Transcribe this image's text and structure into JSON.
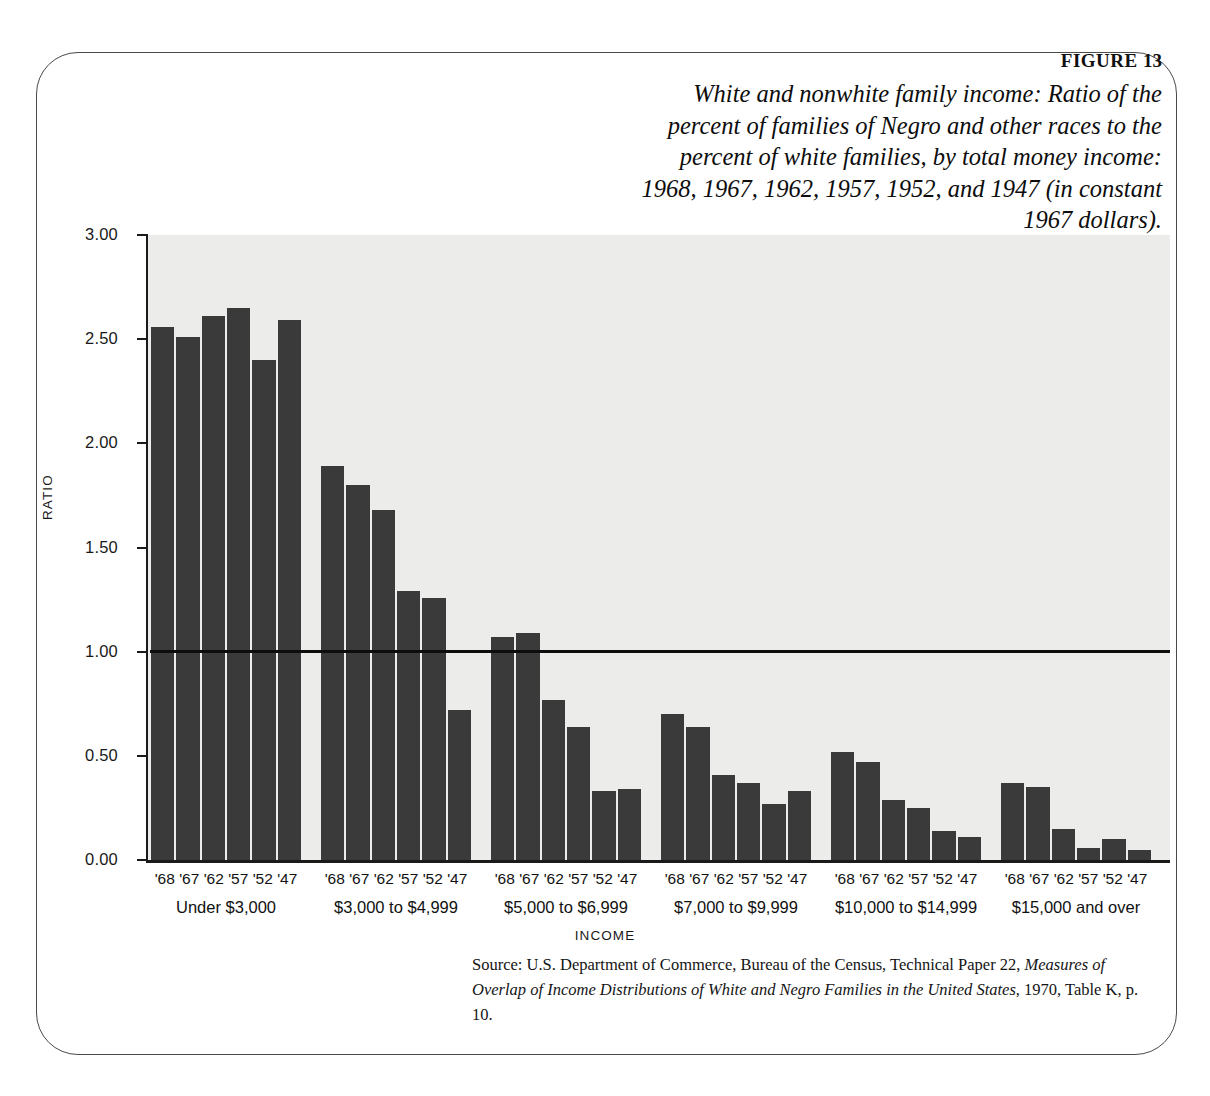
{
  "figure": {
    "label_prefix": "FIGURE",
    "label_number": "13",
    "title": "White and nonwhite family income: Ratio of the percent of families of Negro and other races to the percent of white families, by total money income: 1968, 1967, 1962, 1957, 1952, and 1947 (in constant 1967 dollars).",
    "note": "In this figure, a ratio of 1.00 would mean that equal percentages of white and nonwhite families were at that income level; a ratio of 2.00 would mean that the percentage of nonwhite families at that income level was twice as high as the percentage of white families.",
    "source_prefix": "Source: U.S. Department of Commerce, Bureau of the Census, Technical Paper 22, ",
    "source_italic_1": "Measures of Overlap of Income Distributions of White and Negro Families in the United States",
    "source_suffix": ", 1970, Table K, p. 10."
  },
  "colors": {
    "bar": "#3a3a3a",
    "plot_background": "#ececeb",
    "axis": "#1a1a1a",
    "reference_line": "#0d0d0d",
    "page_background": "#ffffff",
    "frame": "#4a4a4a"
  },
  "chart_data": {
    "type": "bar",
    "title": "White and nonwhite family income: Ratio of the percent of families of Negro and other races to the percent of white families, by total money income: 1968, 1967, 1962, 1957, 1952, and 1947 (in constant 1967 dollars).",
    "xlabel": "INCOME",
    "ylabel": "RATIO",
    "ylim": [
      0.0,
      3.0
    ],
    "ytick_labels": [
      "0.00",
      "0.50",
      "1.00",
      "1.50",
      "2.00",
      "2.50",
      "3.00"
    ],
    "ytick_values": [
      0.0,
      0.5,
      1.0,
      1.5,
      2.0,
      2.5,
      3.0
    ],
    "grid": false,
    "legend": "none",
    "reference_line": {
      "value": 1.0,
      "label": "1.00"
    },
    "categories": [
      "Under $3,000",
      "$3,000 to $4,999",
      "$5,000 to $6,999",
      "$7,000 to $9,999",
      "$10,000 to $14,999",
      "$15,000 and over"
    ],
    "subcategories": [
      "'68",
      "'67",
      "'62",
      "'57",
      "'52",
      "'47"
    ],
    "groups": [
      {
        "category": "Under $3,000",
        "values": [
          2.56,
          2.51,
          2.61,
          2.65,
          2.4,
          2.59
        ]
      },
      {
        "category": "$3,000 to $4,999",
        "values": [
          1.89,
          1.8,
          1.68,
          1.29,
          1.26,
          0.72
        ]
      },
      {
        "category": "$5,000 to $6,999",
        "values": [
          1.07,
          1.09,
          0.77,
          0.64,
          0.33,
          0.34
        ]
      },
      {
        "category": "$7,000 to $9,999",
        "values": [
          0.7,
          0.64,
          0.41,
          0.37,
          0.27,
          0.33
        ]
      },
      {
        "category": "$10,000 to $14,999",
        "values": [
          0.52,
          0.47,
          0.29,
          0.25,
          0.14,
          0.11
        ]
      },
      {
        "category": "$15,000 and over",
        "values": [
          0.37,
          0.35,
          0.15,
          0.06,
          0.1,
          0.05
        ]
      }
    ]
  }
}
